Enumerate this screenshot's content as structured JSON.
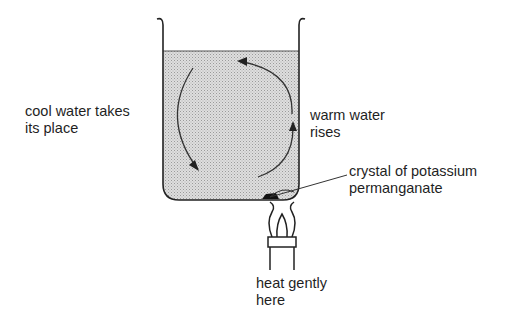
{
  "diagram": {
    "labels": {
      "cool_water": [
        "cool water takes",
        "its place"
      ],
      "warm_water": [
        "warm water",
        "rises"
      ],
      "crystal": [
        "crystal of potassium",
        "permanganate"
      ],
      "heat": [
        "heat gently",
        "here"
      ]
    },
    "components": [
      "beaker",
      "water",
      "circulation-arrows",
      "potassium-permanganate-crystal",
      "burner-flame",
      "burner"
    ],
    "colors": {
      "line": "#222222",
      "water_fill": "#d4d4d4",
      "background": "#ffffff"
    }
  }
}
